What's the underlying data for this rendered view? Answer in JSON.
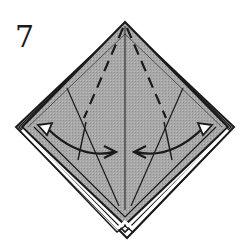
{
  "step": {
    "number": "7"
  },
  "diagram": {
    "shape": "diamond",
    "paper_color": "#a6a6a6",
    "edge_color": "#1a1a1a",
    "layer_color": "#ffffff",
    "arrow_fill": "#ffffff",
    "folds": [
      {
        "type": "valley-dashed",
        "side": "left"
      },
      {
        "type": "valley-dashed",
        "side": "right"
      },
      {
        "type": "center-line"
      }
    ],
    "arrows": [
      {
        "direction": "fold-out-and-back",
        "side": "left"
      },
      {
        "direction": "fold-out-and-back",
        "side": "right"
      }
    ]
  }
}
